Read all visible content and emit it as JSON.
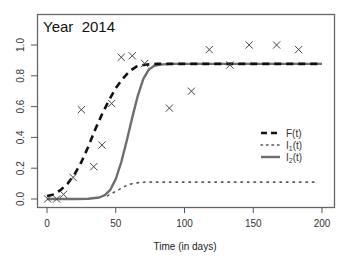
{
  "chart_data": {
    "type": "line",
    "title": "Year  2014",
    "xlabel": "Time (in days)",
    "ylabel": "",
    "xlim": [
      0,
      200
    ],
    "ylim": [
      0,
      1.0
    ],
    "x_ticks": [
      0,
      50,
      100,
      150,
      200
    ],
    "y_ticks": [
      0.0,
      0.2,
      0.4,
      0.6,
      0.8,
      1.0
    ],
    "x_tick_labels": [
      "0",
      "50",
      "100",
      "150",
      "200"
    ],
    "y_tick_labels": [
      "0.0",
      "0.2",
      "0.4",
      "0.6",
      "0.8",
      "1.0"
    ],
    "grid": false,
    "legend_position": "right",
    "observations": {
      "name": "observed",
      "marker": "x",
      "points": [
        [
          0.5,
          0.0
        ],
        [
          7,
          0.0
        ],
        [
          12,
          0.03
        ],
        [
          19,
          0.14
        ],
        [
          25,
          0.58
        ],
        [
          34,
          0.21
        ],
        [
          40,
          0.35
        ],
        [
          47,
          0.62
        ],
        [
          54,
          0.92
        ],
        [
          62,
          0.93
        ],
        [
          71,
          0.88
        ],
        [
          89,
          0.59
        ],
        [
          105,
          0.7
        ],
        [
          118,
          0.97
        ],
        [
          133,
          0.87
        ],
        [
          147,
          1.0
        ],
        [
          167,
          1.0
        ],
        [
          183,
          0.97
        ]
      ]
    },
    "series": [
      {
        "name": "F(t)",
        "label_main": "F",
        "label_sub": "",
        "style": "dashed",
        "color": "#111111",
        "x": [
          0,
          5,
          10,
          15,
          20,
          25,
          30,
          35,
          40,
          45,
          50,
          55,
          60,
          65,
          70,
          75,
          80,
          90,
          100,
          150,
          200
        ],
        "values": [
          0.02,
          0.03,
          0.06,
          0.1,
          0.16,
          0.24,
          0.34,
          0.45,
          0.55,
          0.64,
          0.72,
          0.78,
          0.83,
          0.86,
          0.87,
          0.875,
          0.877,
          0.877,
          0.877,
          0.877,
          0.877
        ]
      },
      {
        "name": "I1(t)",
        "label_main": "I",
        "label_sub": "1",
        "style": "dotted",
        "color": "#555555",
        "x": [
          44,
          48,
          52,
          56,
          60,
          64,
          68,
          72,
          80,
          100,
          150,
          196
        ],
        "values": [
          0.02,
          0.04,
          0.06,
          0.08,
          0.095,
          0.103,
          0.108,
          0.11,
          0.11,
          0.11,
          0.11,
          0.11
        ]
      },
      {
        "name": "I2(t)",
        "label_main": "I",
        "label_sub": "2",
        "style": "solid",
        "color": "#6e6e6e",
        "x": [
          0,
          10,
          20,
          30,
          38,
          42,
          46,
          50,
          54,
          58,
          62,
          66,
          70,
          74,
          78,
          82,
          90,
          100,
          150,
          200
        ],
        "values": [
          0.0,
          0.0,
          0.0,
          0.002,
          0.01,
          0.025,
          0.06,
          0.13,
          0.24,
          0.38,
          0.53,
          0.67,
          0.78,
          0.84,
          0.865,
          0.873,
          0.877,
          0.877,
          0.877,
          0.877
        ]
      }
    ]
  }
}
